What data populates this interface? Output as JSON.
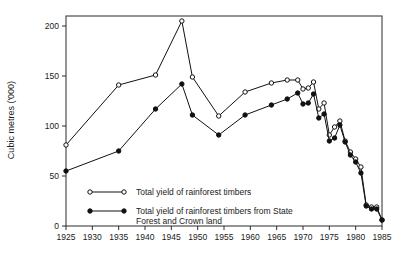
{
  "chart_data": {
    "type": "line",
    "title": "",
    "xlabel": "",
    "ylabel": "Cubic metres ('000)",
    "xlim": [
      1925,
      1985
    ],
    "ylim": [
      0,
      210
    ],
    "grid": false,
    "legend_position": "inside-lower-left",
    "xticks": [
      1925,
      1930,
      1935,
      1940,
      1945,
      1950,
      1955,
      1960,
      1965,
      1970,
      1975,
      1980,
      1985
    ],
    "yticks": [
      0,
      50,
      100,
      150,
      200
    ],
    "series": [
      {
        "name": "Total yield of rainforest timbers",
        "marker": "open-circle",
        "color": "#111111",
        "x": [
          1925,
          1935,
          1942,
          1947,
          1949,
          1954,
          1959,
          1964,
          1967,
          1969,
          1970,
          1971,
          1972,
          1973,
          1974,
          1975,
          1976,
          1977,
          1978,
          1979,
          1980,
          1981,
          1982,
          1983,
          1984,
          1985
        ],
        "values": [
          81,
          141,
          151,
          205,
          149,
          110,
          134,
          143,
          146,
          146,
          137,
          138,
          144,
          117,
          123,
          91,
          99,
          105,
          85,
          74,
          67,
          59,
          21,
          19,
          19,
          6
        ]
      },
      {
        "name": "Total yield of rainforest timbers from State Forest and Crown land",
        "marker": "filled-circle",
        "color": "#111111",
        "x": [
          1925,
          1935,
          1942,
          1947,
          1949,
          1954,
          1959,
          1964,
          1967,
          1969,
          1970,
          1971,
          1972,
          1973,
          1974,
          1975,
          1976,
          1977,
          1978,
          1979,
          1980,
          1981,
          1982,
          1983,
          1984,
          1985
        ],
        "values": [
          55,
          75,
          117,
          142,
          111,
          91,
          111,
          121,
          127,
          133,
          122,
          123,
          132,
          108,
          112,
          85,
          88,
          101,
          84,
          71,
          64,
          53,
          20,
          17,
          17,
          6
        ]
      }
    ]
  },
  "legend": {
    "entries": [
      {
        "label": "Total yield of rainforest timbers",
        "marker": "open-circle"
      },
      {
        "label": "Total yield of rainforest timbers from State",
        "label_line2": "Forest and Crown land",
        "marker": "filled-circle"
      }
    ]
  },
  "colors": {
    "line": "#111111",
    "frame": "#2b2b2b",
    "background": "#ffffff",
    "text": "#1a1a1a"
  }
}
